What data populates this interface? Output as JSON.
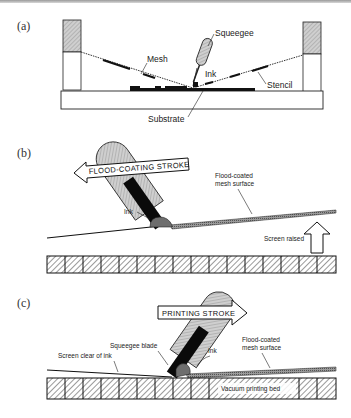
{
  "figure": {
    "panels": [
      {
        "id": "a",
        "label": "(a)",
        "annotations": {
          "squeegee": "Squeegee",
          "mesh": "Mesh",
          "ink": "Ink",
          "stencil": "Stencil",
          "substrate": "Substrate"
        }
      },
      {
        "id": "b",
        "label": "(b)",
        "stroke_arrow": "FLOOD-COATING STROKE",
        "stroke_direction": "left",
        "annotations": {
          "ink": "Ink",
          "flood_coated_line1": "Flood-coated",
          "flood_coated_line2": "mesh surface",
          "screen_raised": "Screen raised"
        }
      },
      {
        "id": "c",
        "label": "(c)",
        "stroke_arrow": "PRINTING STROKE",
        "stroke_direction": "right",
        "annotations": {
          "squeegee_blade": "Squeegee blade",
          "ink": "Ink",
          "screen_clear": "Screen clear of ink",
          "flood_coated_line1": "Flood-coated",
          "flood_coated_line2": "mesh surface",
          "vacuum_bed": "Vacuum printing bed"
        }
      }
    ],
    "colors": {
      "line": "#111111",
      "handle_fill": "#bdbdbd",
      "blade_fill": "#0a0a0a",
      "ink_fill": "#6e6e6e",
      "hatch": "#555555"
    }
  }
}
